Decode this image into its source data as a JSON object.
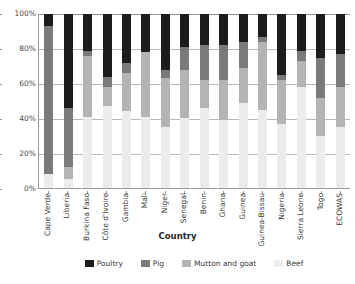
{
  "chart_data": {
    "type": "bar",
    "subtype": "100% stacked column",
    "title": "",
    "xlabel": "Country",
    "ylabel": "",
    "ylim": [
      0,
      100
    ],
    "yticks": [
      "0%",
      "20%",
      "40%",
      "60%",
      "80%",
      "100%"
    ],
    "ytick_values": [
      0,
      20,
      40,
      60,
      80,
      100
    ],
    "grid": true,
    "legend_position": "bottom",
    "stack_order_bottom_to_top": [
      "Beef",
      "Mutton and goat",
      "Pig",
      "Poultry"
    ],
    "categories": [
      "Cape Verde",
      "Liberia",
      "Burkina Faso",
      "Côte d'Ivoire",
      "Gambia",
      "Mali",
      "Niger",
      "Senegal",
      "Benin",
      "Ghana",
      "Guinea",
      "Guinea-Bissau",
      "Nigeria",
      "Sierra Leone",
      "Togo",
      "ECOWAS"
    ],
    "series": [
      {
        "name": "Beef",
        "color": "#ececec",
        "values": [
          8,
          5,
          41,
          47,
          44,
          41,
          35,
          40,
          46,
          39,
          49,
          45,
          37,
          58,
          30,
          35
        ]
      },
      {
        "name": "Mutton and goat",
        "color": "#b4b4b4",
        "values": [
          0,
          7,
          35,
          11,
          22,
          37,
          28,
          28,
          16,
          23,
          20,
          39,
          25,
          15,
          22,
          23
        ]
      },
      {
        "name": "Pig",
        "color": "#7a7a7a",
        "values": [
          85,
          34,
          3,
          6,
          6,
          0,
          5,
          13,
          20,
          20,
          15,
          3,
          3,
          6,
          23,
          19
        ]
      },
      {
        "name": "Poultry",
        "color": "#1c1c1c",
        "values": [
          7,
          54,
          21,
          36,
          28,
          22,
          32,
          19,
          18,
          18,
          16,
          13,
          35,
          21,
          25,
          23
        ]
      }
    ]
  },
  "legend": {
    "items": [
      {
        "label": "Poultry",
        "color": "#1c1c1c"
      },
      {
        "label": "Pig",
        "color": "#7a7a7a"
      },
      {
        "label": "Mutton and goat",
        "color": "#b4b4b4"
      },
      {
        "label": "Beef",
        "color": "#ececec"
      }
    ]
  }
}
